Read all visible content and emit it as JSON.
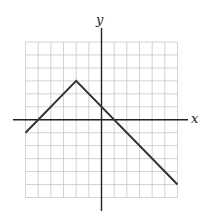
{
  "chart_data": {
    "type": "line",
    "title": "",
    "xlabel": "x",
    "ylabel": "y",
    "xlim": [
      -6,
      6
    ],
    "ylim": [
      -6,
      6
    ],
    "grid": true,
    "grid_step": 1,
    "legend": null,
    "series": [
      {
        "name": "piecewise linear function",
        "points": [
          [
            -6,
            -1
          ],
          [
            -2,
            3
          ],
          [
            6,
            -5
          ]
        ]
      }
    ],
    "key_points": {
      "vertex": [
        -2,
        3
      ],
      "y_intercept": [
        0,
        1
      ],
      "x_intercepts": [
        [
          -5,
          0
        ],
        [
          1,
          0
        ]
      ],
      "left_endpoint": [
        -6,
        -1
      ],
      "right_endpoint": [
        6,
        -5
      ]
    }
  },
  "labels": {
    "x_axis": "x",
    "y_axis": "y"
  },
  "colors": {
    "grid": "#c8c8c8",
    "axis": "#222222",
    "line": "#333333"
  }
}
